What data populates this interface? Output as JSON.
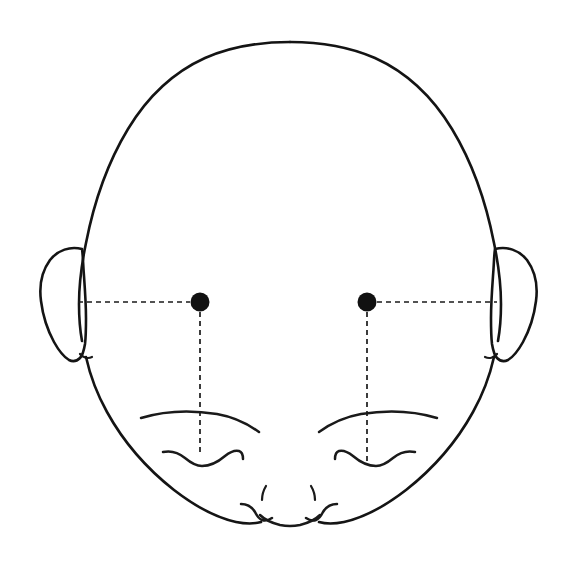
{
  "figure": {
    "title": "Infant head front view with bilateral landmark points",
    "background_color": "#ffffff",
    "stroke_color": "#1a1a1a",
    "marker_color": "#111111",
    "width": 577,
    "height": 570,
    "visible_text": ""
  },
  "anatomy": {
    "cranium_label": "cranium-outline",
    "left_ear_label": "left-ear",
    "right_ear_label": "right-ear",
    "left_eyebrow_label": "left-eyebrow",
    "right_eyebrow_label": "right-eyebrow",
    "left_eye_label": "left-closed-eye",
    "right_eye_label": "right-closed-eye",
    "nose_label": "nose-nostrils",
    "mouth_label": "mouth-lips",
    "chin_label": "chin-contour"
  },
  "landmarks": [
    {
      "name": "left-landmark-point",
      "cx": 200,
      "cy": 302,
      "r": 9.5,
      "color": "#111111"
    },
    {
      "name": "right-landmark-point",
      "cx": 367,
      "cy": 302,
      "r": 9.5,
      "color": "#111111"
    }
  ],
  "reference_lines": [
    {
      "name": "left-horizontal-reference-line",
      "orientation": "horizontal",
      "x1": 78,
      "y1": 302,
      "x2": 190,
      "y2": 302,
      "dash": "5 4"
    },
    {
      "name": "right-horizontal-reference-line",
      "orientation": "horizontal",
      "x1": 377,
      "y1": 302,
      "x2": 497,
      "y2": 302,
      "dash": "5 4"
    },
    {
      "name": "left-vertical-reference-line",
      "orientation": "vertical",
      "x1": 200,
      "y1": 312,
      "x2": 200,
      "y2": 455,
      "dash": "5 4"
    },
    {
      "name": "right-vertical-reference-line",
      "orientation": "vertical",
      "x1": 367,
      "y1": 312,
      "x2": 367,
      "y2": 462,
      "dash": "5 4"
    }
  ],
  "paths": {
    "cranium": "M 288 42 C 243 42 207 52 180 70 C 146 92 120 128 103 172 C 86 216 78 262 78 300 C 78 328 81 352 86 370 C 94 398 106 425 122 450 C 140 478 163 500 190 514 C 205 522 220 526 236 527 C 247 527 256 526 264 523 C 272 527 281 529 290 529 C 299 529 308 527 316 523 C 324 526 333 527 344 527 C 360 526 375 522 390 514 C 417 500 440 478 458 450 C 474 425 486 398 494 370 C 499 352 502 328 502 300 C 502 262 494 216 477 172 C 460 128 434 92 400 70 C 373 52 333 42 288 42 Z",
    "left_ear": "M 81 248 C 68 246 56 252 49 263 C 42 274 40 289 42 303 C 44 318 49 331 55 341 C 60 350 65 356 70 359 C 73 361 76 361 79 359 C 82 357 84 353 85 348 C 86 342 86 334 86 326 C 86 318 85 310 85 302 C 84 288 83 272 82 260 C 82 254 82 250 81 248 Z",
    "left_ear_notch": "M 80 355 C 82 357 85 357 88 355",
    "right_ear": "M 499 248 C 512 246 524 252 531 263 C 538 274 540 289 538 303 C 536 318 531 331 525 341 C 520 350 515 356 510 359 C 507 361 504 361 501 359 C 498 357 496 353 495 348 C 494 342 494 334 494 326 C 494 318 495 310 495 302 C 496 288 497 272 498 260 C 498 254 498 250 499 248 Z",
    "right_ear_notch": "M 500 355 C 498 357 495 357 492 355",
    "left_eyebrow": "M 141 418 C 163 412 190 411 214 415 C 231 418 245 424 256 431",
    "right_eyebrow": "M 436 418 C 414 412 387 411 363 415 C 346 418 332 424 321 431",
    "left_eye": "M 163 453 C 171 451 178 453 184 458 C 189 462 194 465 200 465 C 208 465 216 461 223 456 C 228 452 233 450 237 451 C 240 452 241 455 241 458",
    "right_eye": "M 414 453 C 406 451 399 453 393 458 C 388 462 383 465 377 465 C 369 465 361 461 354 456 C 349 452 344 450 340 451 C 337 452 336 455 336 458",
    "nostril_left": "M 268 487 C 265 491 264 495 264 499",
    "nostril_right": "M 309 487 C 312 491 313 495 313 499",
    "mouth_left": "M 240 503 C 246 503 251 506 254 511 C 256 515 258 518 261 519 C 264 520 268 519 271 517",
    "mouth_right": "M 337 503 C 331 503 326 506 323 511 C 321 515 319 518 316 519 C 313 520 309 519 306 517",
    "mouth_center": "M 259 514 C 263 518 269 521 277 523 C 283 524 288 525 290 525 C 292 525 297 524 303 523 C 311 521 317 518 321 514"
  }
}
